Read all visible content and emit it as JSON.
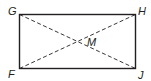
{
  "diagram": {
    "type": "rectangle-with-diagonals",
    "vertices": [
      {
        "label": "G",
        "position": "top-left"
      },
      {
        "label": "H",
        "position": "top-right"
      },
      {
        "label": "J",
        "position": "bottom-right"
      },
      {
        "label": "F",
        "position": "bottom-left"
      }
    ],
    "intersection": {
      "label": "M"
    },
    "labels": {
      "G": "G",
      "H": "H",
      "F": "F",
      "J": "J",
      "M": "M"
    },
    "diagonals": [
      "GJ",
      "FH"
    ],
    "colors": {
      "stroke": "#231f20",
      "background": "#ffffff"
    }
  }
}
